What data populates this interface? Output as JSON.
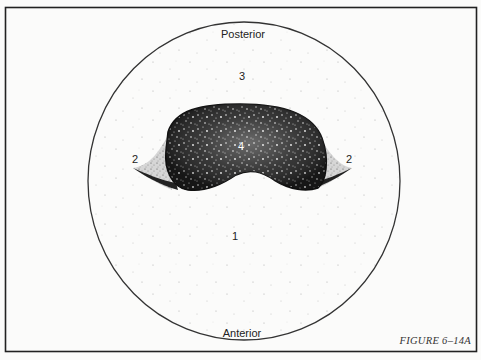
{
  "figure": {
    "caption": "FIGURE 6–14A",
    "orientation": {
      "top": "Posterior",
      "bottom": "Anterior"
    },
    "regions": [
      {
        "id": "region-1",
        "label": "1"
      },
      {
        "id": "region-2-left",
        "label": "2"
      },
      {
        "id": "region-2-right",
        "label": "2"
      },
      {
        "id": "region-3",
        "label": "3"
      },
      {
        "id": "region-4",
        "label": "4"
      }
    ],
    "colors": {
      "frame": "#222222",
      "outline": "#333333",
      "dark_region": "#1a1a1a",
      "background": "#fbfbfa"
    }
  }
}
